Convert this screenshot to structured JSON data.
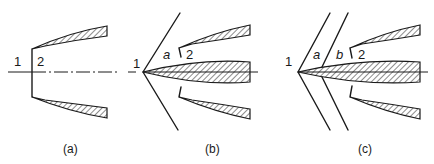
{
  "figure": {
    "panels": [
      {
        "id": "a",
        "caption": "(a)",
        "labels": {
          "region_1": "1",
          "region_2": "2"
        }
      },
      {
        "id": "b",
        "caption": "(b)",
        "labels": {
          "region_1": "1",
          "region_a": "a",
          "region_2": "2"
        }
      },
      {
        "id": "c",
        "caption": "(c)",
        "labels": {
          "region_1": "1",
          "region_a": "a",
          "region_b": "b",
          "region_2": "2"
        }
      }
    ]
  }
}
